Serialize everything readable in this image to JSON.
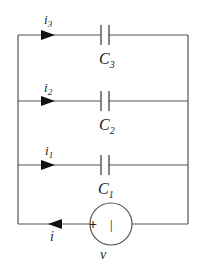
{
  "diagram": {
    "type": "circuit",
    "branches": [
      {
        "current_label": "i",
        "current_sub": "3",
        "component": "C",
        "component_sub": "3"
      },
      {
        "current_label": "i",
        "current_sub": "2",
        "component": "C",
        "component_sub": "2"
      },
      {
        "current_label": "i",
        "current_sub": "1",
        "component": "C",
        "component_sub": "1"
      }
    ],
    "source": {
      "plus_sign": "+",
      "minus_sign": "|",
      "voltage_label": "v",
      "current_label": "i"
    }
  }
}
